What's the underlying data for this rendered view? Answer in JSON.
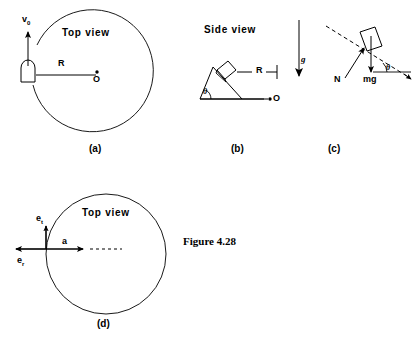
{
  "figure": {
    "caption": "Figure 4.28",
    "panels": [
      {
        "id": "a",
        "label": "(a)",
        "view_label": "Top view",
        "annotations": {
          "velocity": "v",
          "velocity_sub": "0",
          "radius": "R",
          "center": "O"
        }
      },
      {
        "id": "b",
        "label": "(b)",
        "view_label": "Side view",
        "annotations": {
          "radius": "R",
          "center": "O",
          "gravity": "g",
          "angle": "θ"
        }
      },
      {
        "id": "c",
        "label": "(c)",
        "annotations": {
          "normal_force": "N",
          "weight": "mg",
          "angle": "θ"
        }
      },
      {
        "id": "d",
        "label": "(d)",
        "view_label": "Top view",
        "annotations": {
          "unit_tangential": "e",
          "unit_tangential_sub": "t",
          "unit_radial": "e",
          "unit_radial_sub": "r",
          "acceleration": "a"
        }
      }
    ]
  },
  "colors": {
    "ink": "#000000",
    "paper": "#ffffff"
  }
}
